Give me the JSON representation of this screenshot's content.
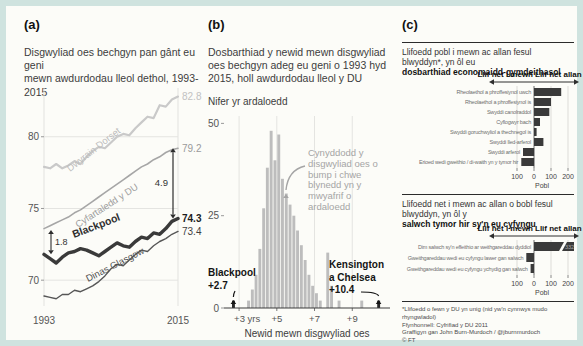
{
  "colors": {
    "frame_border": "#cfe3df",
    "canvas": "#fcfcf8",
    "bar_gray": "#bdbdbd",
    "bar_dark": "#262626",
    "flow_bar": "#3a3a3a",
    "annotation_gray": "#a5a5a5"
  },
  "panels": {
    "a_label": "(a)",
    "b_label": "(b)",
    "c_label": "(c)"
  },
  "footnote": {
    "lines": [
      "*Llifoedd o fewn y DU yn unig (nid yw'n cynnwys mudo rhyngwladol)",
      "Ffynhonnell: Cyfrifiad y DU 2011",
      "Graffigyn gan John Burn-Murdoch / @jburnmurdoch",
      "© FT"
    ]
  },
  "chart_data": [
    {
      "panel": "a",
      "type": "line",
      "title_lines": [
        "Disgwyliad oes bechgyn pan gânt eu geni",
        "mewn awdurdodau lleol dethol, 1993-2015"
      ],
      "x_range": [
        1993,
        2015
      ],
      "x_ticks": [
        "1993",
        "2015"
      ],
      "y_ticks": [
        80,
        75,
        70
      ],
      "ylim": [
        68.2,
        83.4
      ],
      "series": [
        {
          "name": "Dwyrain Dorset",
          "color": "#c9c9c9",
          "width": 2.2,
          "end_label": "82.8",
          "end_label_color": "#c2c2c2",
          "end_bold": false,
          "values": [
            77.9,
            77.8,
            78.1,
            77.8,
            78.0,
            78.3,
            78.1,
            78.6,
            79.0,
            79.3,
            79.2,
            79.6,
            80.0,
            80.2,
            80.1,
            80.6,
            81.0,
            81.4,
            81.3,
            82.2,
            82.1,
            82.6,
            82.8
          ]
        },
        {
          "name": "Cyfartaledd y DU",
          "color": "#a6a6a6",
          "width": 1.6,
          "end_label": "79.2",
          "end_label_color": "#9a9a9a",
          "end_bold": false,
          "values": [
            73.6,
            73.8,
            74.0,
            74.2,
            74.4,
            74.7,
            74.9,
            75.2,
            75.5,
            75.8,
            76.1,
            76.4,
            76.7,
            77.0,
            77.3,
            77.6,
            77.9,
            78.1,
            78.4,
            78.6,
            78.9,
            79.1,
            79.2
          ]
        },
        {
          "name": "Blackpool",
          "color": "#3a3a3a",
          "width": 3.4,
          "end_label": "74.3",
          "end_label_color": "#1d1d1d",
          "end_bold": true,
          "values": [
            71.8,
            71.5,
            71.2,
            71.6,
            71.9,
            72.0,
            72.2,
            72.1,
            71.9,
            71.7,
            72.0,
            72.3,
            72.6,
            72.4,
            72.3,
            72.7,
            73.0,
            72.9,
            73.3,
            73.2,
            73.6,
            74.1,
            74.3
          ]
        },
        {
          "name": "Dinas Glasgow",
          "color": "#565656",
          "width": 1.4,
          "end_label": "73.4",
          "end_label_color": "#3f3f3f",
          "end_bold": false,
          "values": [
            68.9,
            68.8,
            68.7,
            69.0,
            69.0,
            69.3,
            69.2,
            69.4,
            69.6,
            69.9,
            70.3,
            70.8,
            71.1,
            71.0,
            71.4,
            71.8,
            72.1,
            72.0,
            72.4,
            72.7,
            72.9,
            73.2,
            73.4
          ]
        }
      ],
      "annotations": {
        "gap_right": {
          "label": "4.9",
          "from": 79.2,
          "to": 74.3
        },
        "gap_left": {
          "label": "1.8",
          "from": 73.5,
          "to": 71.8
        }
      }
    },
    {
      "panel": "b",
      "type": "bar",
      "title_lines": [
        "Dosbarthiad y newid mewn disgwyliad",
        "oes bechgyn adeg eu geni o 1993 hyd",
        "2015, holl awdurdodau lleol y DU"
      ],
      "ylabel": "Nifer yr ardaloedd",
      "xlabel": "Newid mewn disgwyliad oes",
      "xlim": [
        2.2,
        11.0
      ],
      "ylim": [
        0,
        52
      ],
      "y_ticks": [
        50,
        25,
        0
      ],
      "x_gridlines": [
        3,
        5,
        7,
        9
      ],
      "x_tick_labels": [
        {
          "v": 3,
          "label": "+3 yrs",
          "anchor": "start"
        },
        {
          "v": 5,
          "label": "+5",
          "anchor": "middle"
        },
        {
          "v": 7,
          "label": "+7",
          "anchor": "middle"
        },
        {
          "v": 9,
          "label": "+9",
          "anchor": "middle"
        }
      ],
      "bin_width": 0.2,
      "bars": [
        {
          "x": 3.5,
          "h": 2
        },
        {
          "x": 3.7,
          "h": 5
        },
        {
          "x": 3.9,
          "h": 9
        },
        {
          "x": 4.1,
          "h": 16
        },
        {
          "x": 4.3,
          "h": 27
        },
        {
          "x": 4.5,
          "h": 38
        },
        {
          "x": 4.7,
          "h": 48
        },
        {
          "x": 4.9,
          "h": 40
        },
        {
          "x": 5.1,
          "h": 47
        },
        {
          "x": 5.3,
          "h": 35
        },
        {
          "x": 5.5,
          "h": 31
        },
        {
          "x": 5.7,
          "h": 28
        },
        {
          "x": 5.9,
          "h": 25
        },
        {
          "x": 6.1,
          "h": 21
        },
        {
          "x": 6.3,
          "h": 17
        },
        {
          "x": 6.5,
          "h": 13
        },
        {
          "x": 6.7,
          "h": 9
        },
        {
          "x": 6.9,
          "h": 6
        },
        {
          "x": 7.1,
          "h": 4
        },
        {
          "x": 7.3,
          "h": 2
        },
        {
          "x": 7.7,
          "h": 15
        },
        {
          "x": 7.9,
          "h": 6
        },
        {
          "x": 8.3,
          "h": 2
        },
        {
          "x": 9.5,
          "h": 2
        }
      ],
      "highlight_bars": [
        {
          "x": 2.7,
          "h": 2,
          "name": "Blackpool"
        },
        {
          "x": 10.4,
          "h": 2,
          "name": "Kensington a Chelsea"
        }
      ],
      "annotation_lines": [
        "Cynyddodd y",
        "disgwyliad oes o",
        "bump i chwe",
        "blynedd yn y",
        "mwyafrif o",
        "ardaloedd"
      ],
      "callout_left": [
        "Blackpool",
        "+2.7"
      ],
      "callout_right": [
        "Kensington",
        "a Chelsea",
        "+10.4"
      ]
    },
    {
      "panel": "c",
      "type": "bar",
      "orientation": "horizontal",
      "title_normal": "Llifoedd pobl i mewn ac allan fesul blwyddyn*, yn ôl eu",
      "title_bold": "dosbarthiad economaidd-gymdeithasol",
      "flow_in_label": "Llif net i mewn",
      "flow_out_label": "Llif net allan",
      "categories": [
        "Rheolaethol a phroffesiynol uwch",
        "Rheolaethol a phroffesiynol is",
        "Swyddi canolraddol",
        "Cyflogwyr bach",
        "Swyddi goruchwyliol a thechnegol is",
        "Swyddi lled-arferol",
        "Swyddi arferol",
        "Erioed wedi gweithio / di-waith yn y tymor hir"
      ],
      "values": [
        160,
        100,
        90,
        35,
        15,
        55,
        -65,
        -75
      ],
      "x_ticks": [
        {
          "v": -100,
          "label": "100"
        },
        {
          "v": 0,
          "label": "0"
        },
        {
          "v": 100,
          "label": "100"
        },
        {
          "v": 200,
          "label": "200"
        }
      ],
      "xlabel": "Pobl"
    },
    {
      "panel": "c",
      "type": "bar",
      "orientation": "horizontal",
      "title_normal": "Llifoedd net i mewn ac allan o bobl fesul blwyddyn, yn ôl y",
      "title_bold": "salwch tymor hir sy'n eu cyfyngu",
      "flow_in_label": "Llif net i mewn",
      "flow_out_label": "Llif net allan",
      "categories": [
        "Dim salwch sy'n effeithio ar weithgareddau dyddiol",
        "Gweithgareddau wedi eu cyfyngu lawer gan salwch",
        "Gweithgareddau wedi eu cyfyngu ychydig gan salwch"
      ],
      "values": [
        400,
        -45,
        -20
      ],
      "broken_bar_index": 0,
      "broken_bar_label": "332",
      "x_ticks": [
        {
          "v": -100,
          "label": "100"
        },
        {
          "v": 0,
          "label": "0"
        },
        {
          "v": 100,
          "label": "100"
        },
        {
          "v": 200,
          "label": "200"
        }
      ],
      "xlabel": "Pobl"
    }
  ]
}
